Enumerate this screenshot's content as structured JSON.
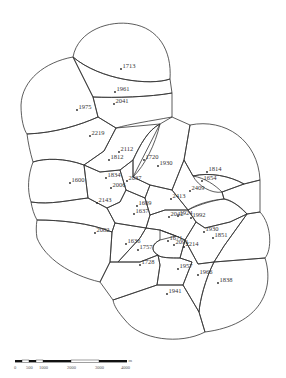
{
  "diagram": {
    "type": "voronoi-tessellation",
    "points": [
      {
        "label": "1713",
        "x": 121,
        "y": 69
      },
      {
        "label": "1961",
        "x": 115,
        "y": 92
      },
      {
        "label": "2041",
        "x": 114,
        "y": 104
      },
      {
        "label": "1975",
        "x": 77,
        "y": 110
      },
      {
        "label": "2219",
        "x": 90,
        "y": 136
      },
      {
        "label": "2112",
        "x": 119,
        "y": 152
      },
      {
        "label": "1812",
        "x": 109,
        "y": 160
      },
      {
        "label": "1720",
        "x": 144,
        "y": 160
      },
      {
        "label": "1930",
        "x": 158,
        "y": 166
      },
      {
        "label": "1814",
        "x": 207,
        "y": 172
      },
      {
        "label": "1654",
        "x": 202,
        "y": 181
      },
      {
        "label": "1600",
        "x": 70,
        "y": 183
      },
      {
        "label": "1834",
        "x": 106,
        "y": 178
      },
      {
        "label": "2037",
        "x": 127,
        "y": 181
      },
      {
        "label": "2006",
        "x": 111,
        "y": 188
      },
      {
        "label": "2409",
        "x": 190,
        "y": 191
      },
      {
        "label": "2143",
        "x": 97,
        "y": 203
      },
      {
        "label": "2413",
        "x": 171,
        "y": 199
      },
      {
        "label": "1609",
        "x": 137,
        "y": 206
      },
      {
        "label": "1637",
        "x": 134,
        "y": 214
      },
      {
        "label": "2042",
        "x": 169,
        "y": 217
      },
      {
        "label": "1924",
        "x": 178,
        "y": 216
      },
      {
        "label": "1992",
        "x": 191,
        "y": 218
      },
      {
        "label": "2082",
        "x": 95,
        "y": 233
      },
      {
        "label": "1930",
        "x": 204,
        "y": 232
      },
      {
        "label": "1851",
        "x": 213,
        "y": 238
      },
      {
        "label": "1636",
        "x": 126,
        "y": 244
      },
      {
        "label": "1671",
        "x": 168,
        "y": 241
      },
      {
        "label": "2091",
        "x": 174,
        "y": 245
      },
      {
        "label": "2214",
        "x": 184,
        "y": 247
      },
      {
        "label": "1757",
        "x": 138,
        "y": 250
      },
      {
        "label": "1728",
        "x": 140,
        "y": 265
      },
      {
        "label": "1957",
        "x": 178,
        "y": 269
      },
      {
        "label": "1966",
        "x": 198,
        "y": 275
      },
      {
        "label": "1838",
        "x": 218,
        "y": 283
      },
      {
        "label": "1941",
        "x": 167,
        "y": 294
      }
    ]
  },
  "scale_bar": {
    "ticks": [
      "0",
      "500",
      "1000",
      "2000",
      "3000",
      "4000"
    ],
    "unit": "m",
    "color_dark": "#111111",
    "color_light": "#ffffff"
  }
}
